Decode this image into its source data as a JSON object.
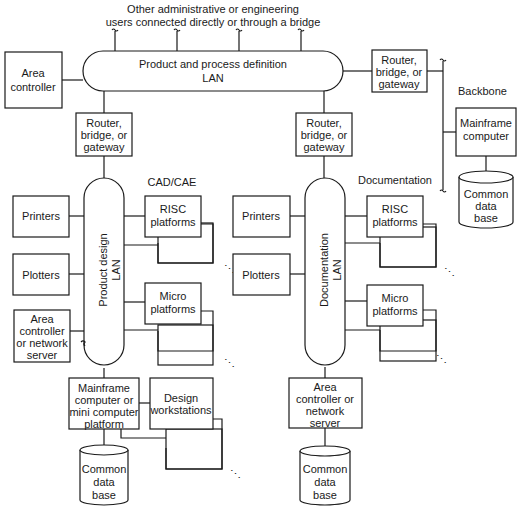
{
  "diagram": {
    "top_note": {
      "line1": "Other administrative or engineering",
      "line2": "users connected directly or through a bridge"
    },
    "top_lan": {
      "line1": "Product and process definition",
      "line2": "LAN"
    },
    "area_controller_top": {
      "line1": "Area",
      "line2": "controller"
    },
    "router_right": {
      "line1": "Router,",
      "line2": "bridge, or",
      "line3": "gateway"
    },
    "backbone": {
      "label": "Backbone",
      "mainframe": {
        "line1": "Mainframe",
        "line2": "computer"
      },
      "database": {
        "line1": "Common",
        "line2": "data",
        "line3": "base"
      }
    },
    "cad_cae": {
      "title": "CAD/CAE",
      "router": {
        "line1": "Router,",
        "line2": "bridge, or",
        "line3": "gateway"
      },
      "lan": {
        "line1": "Product design",
        "line2": "LAN"
      },
      "printers": "Printers",
      "plotters": "Plotters",
      "area_controller": {
        "line1": "Area",
        "line2": "controller",
        "line3": "or network",
        "line4": "server"
      },
      "risc": {
        "line1": "RISC",
        "line2": "platforms"
      },
      "micro": {
        "line1": "Micro",
        "line2": "platforms"
      },
      "mainframe": {
        "line1": "Mainframe",
        "line2": "computer or",
        "line3": "mini computer",
        "line4": "platform"
      },
      "workstations": {
        "line1": "Design",
        "line2": "workstations"
      },
      "database": {
        "line1": "Common",
        "line2": "data",
        "line3": "base"
      }
    },
    "documentation": {
      "title": "Documentation",
      "router": {
        "line1": "Router,",
        "line2": "bridge, or",
        "line3": "gateway"
      },
      "lan": {
        "line1": "Documentation",
        "line2": "LAN"
      },
      "printers": "Printers",
      "plotters": "Plotters",
      "risc": {
        "line1": "RISC",
        "line2": "platforms"
      },
      "micro": {
        "line1": "Micro",
        "line2": "platforms"
      },
      "area_controller": {
        "line1": "Area",
        "line2": "controller or",
        "line3": "network",
        "line4": "server"
      },
      "database": {
        "line1": "Common",
        "line2": "data",
        "line3": "base"
      }
    },
    "ellipsis": "⋱"
  }
}
